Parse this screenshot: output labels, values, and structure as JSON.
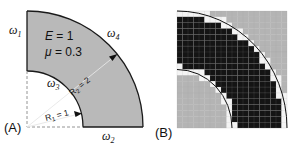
{
  "panel_a": {
    "panel_label": "(A)",
    "material": {
      "E_label": "E",
      "E_eq": " = 1",
      "mu_label": "μ",
      "mu_eq": " = 0.3"
    },
    "boundaries": {
      "w1": {
        "sym": "ω",
        "sub": "1"
      },
      "w2": {
        "sym": "ω",
        "sub": "2"
      },
      "w3": {
        "sym": "ω",
        "sub": "3"
      },
      "w4": {
        "sym": "ω",
        "sub": "4"
      }
    },
    "radii": {
      "r1": {
        "sym": "R",
        "sub": "1",
        "eq": " = 1"
      },
      "r2": {
        "sym": "R",
        "sub": "2",
        "eq": " = 2"
      }
    },
    "colors": {
      "domain_fill": "#b9b9b9",
      "outline": "#1a1a1a",
      "dash": "#888888"
    }
  },
  "panel_b": {
    "panel_label": "(B)",
    "grid": {
      "cols": 20,
      "rows": 20
    },
    "colors": {
      "solid": "#141414",
      "void": "#b4b4b4",
      "boundary": "#f4f4f4",
      "gridline": "#9a9a9a"
    }
  }
}
